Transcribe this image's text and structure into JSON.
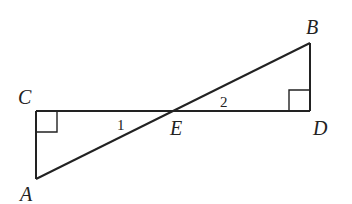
{
  "diagram": {
    "points": {
      "A": {
        "label": "A",
        "x": 36,
        "y": 179
      },
      "B": {
        "label": "B",
        "x": 310,
        "y": 43
      },
      "C": {
        "label": "C",
        "x": 36,
        "y": 111
      },
      "D": {
        "label": "D",
        "x": 310,
        "y": 111
      },
      "E": {
        "label": "E",
        "x": 176,
        "y": 111
      }
    },
    "angles": {
      "angle1": "1",
      "angle2": "2"
    },
    "right_angles": [
      "C",
      "D"
    ],
    "segments": [
      "AC",
      "CD",
      "AB",
      "BD"
    ],
    "stroke_color": "#222222"
  }
}
